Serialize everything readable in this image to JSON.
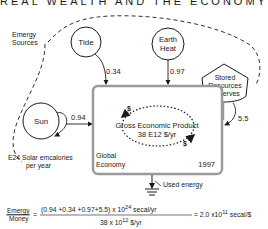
{
  "title": "REAL WEALTH AND THE ECONOMY",
  "boundary_label": [
    "Emergy",
    "Sources"
  ],
  "sources": {
    "tide": {
      "label": "Tide",
      "flow": "0.34"
    },
    "earth_heat": {
      "label_line1": "Earth",
      "label_line2": "Heat",
      "flow": "0.97"
    },
    "sun": {
      "label": "Sun",
      "flow": "0.94",
      "caption_line1": "E24  Solar  emcalories",
      "caption_line2": "per year"
    },
    "stored": {
      "line1": "Stored",
      "line2": "Resources",
      "line3": "Reserves",
      "flow": "5.5"
    }
  },
  "economy": {
    "label_line1": "Global",
    "label_line2": "Economy",
    "year": "1997",
    "gep_line1": "Gross Economic Product",
    "gep_line2": "38  E12 $/yr",
    "dollar": "$"
  },
  "sink": {
    "label": "Used energy"
  },
  "equation": {
    "lhs_top": "Emergy",
    "lhs_bottom": "Money",
    "eq": "=",
    "num": "(0.94 +0.34 +0.97+5.5) x 10",
    "num_exp": "24",
    "num_unit": " secal/yr",
    "den": "38  x 10",
    "den_exp": "12",
    "den_unit": " $/yr",
    "result": "= 2.0 x10",
    "result_exp": "11",
    "result_unit": " secal/$"
  }
}
